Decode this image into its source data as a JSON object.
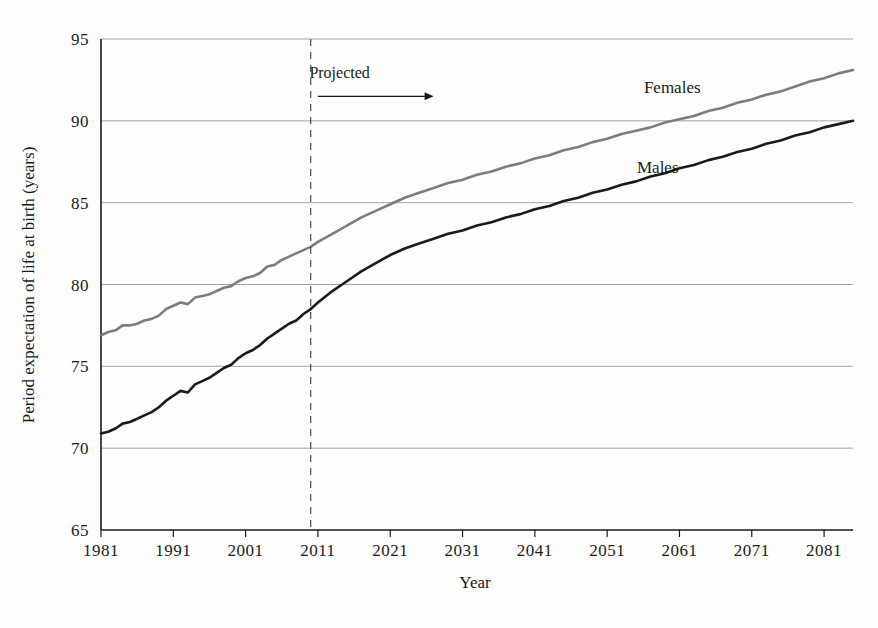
{
  "chart_data": {
    "type": "line",
    "title": "",
    "xlabel": "Year",
    "ylabel": "Period expectation of life at birth (years)",
    "xlim": [
      1981,
      2085
    ],
    "ylim": [
      65,
      95
    ],
    "grid": true,
    "grid_axis": "y",
    "legend": "inline-labels",
    "xticks": [
      "1981",
      "1991",
      "2001",
      "2011",
      "2021",
      "2031",
      "2041",
      "2051",
      "2061",
      "2071",
      "2081"
    ],
    "xtick_values": [
      1981,
      1991,
      2001,
      2011,
      2021,
      2031,
      2041,
      2051,
      2061,
      2071,
      2081
    ],
    "yticks": [
      "65",
      "70",
      "75",
      "80",
      "85",
      "90",
      "95"
    ],
    "ytick_values": [
      65,
      70,
      75,
      80,
      85,
      90,
      95
    ],
    "annotations": [
      {
        "text": "Projected",
        "x": 2014,
        "y": 92.6,
        "kind": "projection-note"
      },
      {
        "text": "",
        "kind": "projection-arrow",
        "x_start": 2011,
        "x_end": 2027,
        "y": 91.5
      },
      {
        "text": "",
        "kind": "projection-divider",
        "x": 2010,
        "style": "dashed"
      }
    ],
    "series": [
      {
        "name": "Females",
        "color": "#7d7d7d",
        "label_x": 2060,
        "label_y": 91.7,
        "x": [
          1981,
          1982,
          1983,
          1984,
          1985,
          1986,
          1987,
          1988,
          1989,
          1990,
          1991,
          1992,
          1993,
          1994,
          1995,
          1996,
          1997,
          1998,
          1999,
          2000,
          2001,
          2002,
          2003,
          2004,
          2005,
          2006,
          2007,
          2008,
          2009,
          2010,
          2011,
          2013,
          2015,
          2017,
          2019,
          2021,
          2023,
          2025,
          2027,
          2029,
          2031,
          2033,
          2035,
          2037,
          2039,
          2041,
          2043,
          2045,
          2047,
          2049,
          2051,
          2053,
          2055,
          2057,
          2059,
          2061,
          2063,
          2065,
          2067,
          2069,
          2071,
          2073,
          2075,
          2077,
          2079,
          2081,
          2083,
          2085
        ],
        "values": [
          76.9,
          77.1,
          77.2,
          77.5,
          77.5,
          77.6,
          77.8,
          77.9,
          78.1,
          78.5,
          78.7,
          78.9,
          78.8,
          79.2,
          79.3,
          79.4,
          79.6,
          79.8,
          79.9,
          80.2,
          80.4,
          80.5,
          80.7,
          81.1,
          81.2,
          81.5,
          81.7,
          81.9,
          82.1,
          82.3,
          82.6,
          83.1,
          83.6,
          84.1,
          84.5,
          84.9,
          85.3,
          85.6,
          85.9,
          86.2,
          86.4,
          86.7,
          86.9,
          87.2,
          87.4,
          87.7,
          87.9,
          88.2,
          88.4,
          88.7,
          88.9,
          89.2,
          89.4,
          89.6,
          89.9,
          90.1,
          90.3,
          90.6,
          90.8,
          91.1,
          91.3,
          91.6,
          91.8,
          92.1,
          92.4,
          92.6,
          92.9,
          93.1
        ]
      },
      {
        "name": "Males",
        "color": "#1a1a1a",
        "label_x": 2058,
        "label_y": 86.8,
        "x": [
          1981,
          1982,
          1983,
          1984,
          1985,
          1986,
          1987,
          1988,
          1989,
          1990,
          1991,
          1992,
          1993,
          1994,
          1995,
          1996,
          1997,
          1998,
          1999,
          2000,
          2001,
          2002,
          2003,
          2004,
          2005,
          2006,
          2007,
          2008,
          2009,
          2010,
          2011,
          2013,
          2015,
          2017,
          2019,
          2021,
          2023,
          2025,
          2027,
          2029,
          2031,
          2033,
          2035,
          2037,
          2039,
          2041,
          2043,
          2045,
          2047,
          2049,
          2051,
          2053,
          2055,
          2057,
          2059,
          2061,
          2063,
          2065,
          2067,
          2069,
          2071,
          2073,
          2075,
          2077,
          2079,
          2081,
          2083,
          2085
        ],
        "values": [
          70.9,
          71.0,
          71.2,
          71.5,
          71.6,
          71.8,
          72.0,
          72.2,
          72.5,
          72.9,
          73.2,
          73.5,
          73.4,
          73.9,
          74.1,
          74.3,
          74.6,
          74.9,
          75.1,
          75.5,
          75.8,
          76.0,
          76.3,
          76.7,
          77.0,
          77.3,
          77.6,
          77.8,
          78.2,
          78.5,
          78.9,
          79.6,
          80.2,
          80.8,
          81.3,
          81.8,
          82.2,
          82.5,
          82.8,
          83.1,
          83.3,
          83.6,
          83.8,
          84.1,
          84.3,
          84.6,
          84.8,
          85.1,
          85.3,
          85.6,
          85.8,
          86.1,
          86.3,
          86.6,
          86.8,
          87.1,
          87.3,
          87.6,
          87.8,
          88.1,
          88.3,
          88.6,
          88.8,
          89.1,
          89.3,
          89.6,
          89.8,
          90.0
        ]
      }
    ]
  },
  "figure": {
    "background_color": "#fdfdfb",
    "axis_color": "#1a1a1a",
    "grid_color": "#9a9a9a"
  }
}
